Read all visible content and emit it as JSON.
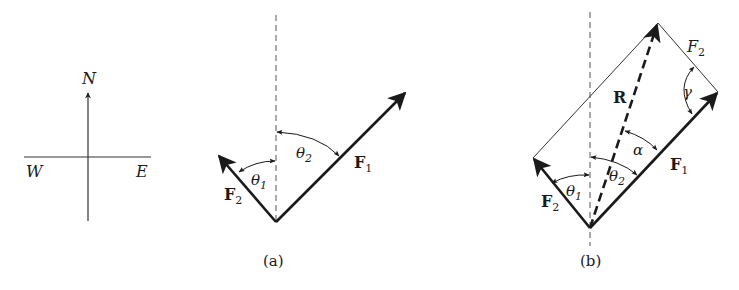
{
  "figure": {
    "type": "vector-force-diagram",
    "colors": {
      "ink": "#1a1a1a",
      "thin_line": "#333333",
      "background": "#ffffff"
    }
  },
  "compass": {
    "north": "N",
    "west": "W",
    "east": "E"
  },
  "panel_a": {
    "caption": "(a)",
    "vectors": [
      {
        "name": "F",
        "sub": "1",
        "bold": true
      },
      {
        "name": "F",
        "sub": "2",
        "bold": true
      }
    ],
    "angles": [
      {
        "symbol": "θ",
        "sub": "1"
      },
      {
        "symbol": "θ",
        "sub": "2"
      }
    ],
    "reference_line": "dashed vertical (north)"
  },
  "panel_b": {
    "caption": "(b)",
    "vectors": [
      {
        "name": "F",
        "sub": "1",
        "bold": true
      },
      {
        "name": "F",
        "sub": "2",
        "bold": true
      },
      {
        "name": "R",
        "sub": "",
        "bold": true,
        "style": "dashed resultant"
      },
      {
        "name": "F",
        "sub": "2",
        "bold": false,
        "style": "translated side"
      }
    ],
    "angles": [
      {
        "symbol": "θ",
        "sub": "1"
      },
      {
        "symbol": "θ",
        "sub": "2"
      },
      {
        "symbol": "α",
        "sub": ""
      },
      {
        "symbol": "γ",
        "sub": ""
      }
    ],
    "reference_line": "dashed vertical (north)"
  }
}
